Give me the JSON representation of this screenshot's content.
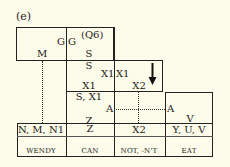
{
  "figure": {
    "label": "(e)"
  },
  "top_box": {
    "left_cell": {
      "G": "G",
      "M": "M"
    },
    "right_cell": {
      "q": "(Q6)",
      "G": "G",
      "S": "S"
    }
  },
  "mid_box": {
    "left_cell": {
      "S": "S",
      "X1": "X1",
      "X1_bottom": "X1"
    },
    "right_cell": {
      "X1": "X1",
      "X2": "X2"
    },
    "arrow": "down-arrow"
  },
  "lower_cell": {
    "S_X1": "S, X1",
    "A_left": "A",
    "Z": "Z",
    "A_right": "A",
    "V": "V"
  },
  "bottom_table": {
    "columns": [
      {
        "top": "N, M, N1",
        "word": "WENDY"
      },
      {
        "top": "Z",
        "word": "CAN"
      },
      {
        "top": "X2",
        "word": "NOT, -N'T"
      },
      {
        "top": "Y, U, V",
        "word": "EAT"
      }
    ]
  }
}
